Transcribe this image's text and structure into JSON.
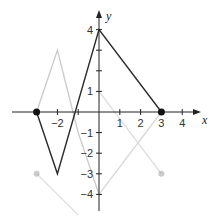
{
  "chart_data": {
    "type": "line",
    "title": "",
    "xlabel": "x",
    "ylabel": "y",
    "xlim": [
      -4,
      4.5
    ],
    "ylim": [
      -4.5,
      4.5
    ],
    "grid": false,
    "x_ticks": [
      -2,
      1,
      2,
      3,
      4
    ],
    "x_tick_labels": [
      "−2",
      "1",
      "2",
      "3",
      "4"
    ],
    "y_ticks": [
      4,
      1,
      -1,
      -2,
      -3,
      -4
    ],
    "y_tick_labels": [
      "4",
      "1",
      "−1",
      "−2",
      "−3",
      "−4"
    ],
    "series": [
      {
        "name": "f(x)",
        "color": "#2b2b2b",
        "points": [
          [
            -3,
            0
          ],
          [
            -2,
            -3
          ],
          [
            0,
            4
          ],
          [
            3,
            0
          ]
        ],
        "endpoints": [
          [
            -3,
            0
          ],
          [
            3,
            0
          ]
        ],
        "endpoint_style": "closed"
      },
      {
        "name": "faint-trace-1",
        "color": "#c8c8c8",
        "points": [
          [
            -3,
            0
          ],
          [
            -2,
            3
          ],
          [
            -1,
            -1
          ],
          [
            0,
            -4
          ]
        ]
      },
      {
        "name": "faint-trace-2",
        "color": "#d8d8d8",
        "points": [
          [
            0,
            -4
          ],
          [
            3,
            0
          ]
        ]
      },
      {
        "name": "faint-trace-3",
        "color": "#dcdcdc",
        "points": [
          [
            0,
            1
          ],
          [
            3,
            -3
          ]
        ],
        "endpoints": [
          [
            3,
            -3
          ]
        ]
      },
      {
        "name": "faint-trace-4",
        "color": "#e0e0e0",
        "points": [
          [
            -3,
            -3
          ],
          [
            -1,
            -5
          ]
        ],
        "endpoints": [
          [
            -3,
            -3
          ]
        ]
      }
    ],
    "legend": []
  },
  "axes": {
    "x_label": "x",
    "y_label": "y"
  }
}
